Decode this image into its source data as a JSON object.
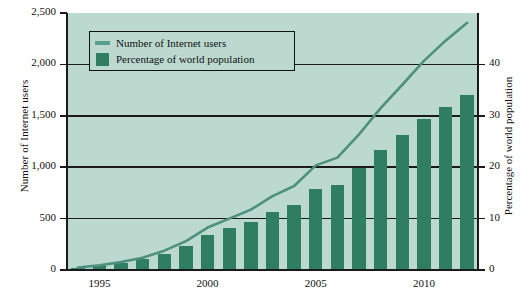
{
  "chart_data": {
    "type": "bar",
    "title": "",
    "xlabel": "",
    "ylabel": "Number of Internet users",
    "ylabel_right": "Percentage of world population",
    "grid": true,
    "legend_position": "top-left-inside",
    "x": [
      1994,
      1995,
      1996,
      1997,
      1998,
      1999,
      2000,
      2001,
      2002,
      2003,
      2004,
      2005,
      2006,
      2007,
      2008,
      2009,
      2010,
      2011,
      2012
    ],
    "xtick_labels": [
      "1995",
      "2000",
      "2005",
      "2010"
    ],
    "xtick_values": [
      1995,
      2000,
      2005,
      2010
    ],
    "ylim": [
      0,
      2500
    ],
    "ytick_labels": [
      "0",
      "500",
      "1,000",
      "1,500",
      "2,000",
      "2,500"
    ],
    "ytick_values": [
      0,
      500,
      1000,
      1500,
      2000,
      2500
    ],
    "ylim_right": [
      0,
      50
    ],
    "ytick_right_labels": [
      "0",
      "10",
      "20",
      "30",
      "40"
    ],
    "ytick_right_values": [
      0,
      10,
      20,
      30,
      40
    ],
    "series": [
      {
        "name": "Number of Internet users",
        "type": "line",
        "axis": "left",
        "unit": "millions",
        "color": "#4e8f7d",
        "values": [
          25,
          45,
          77,
          120,
          188,
          281,
          413,
          500,
          587,
          719,
          817,
          1018,
          1093,
          1319,
          1574,
          1802,
          2034,
          2231,
          2405
        ]
      },
      {
        "name": "Percentage of world population",
        "type": "bar",
        "axis": "right",
        "unit": "percent",
        "color": "#2f7e62",
        "values": [
          0.4,
          0.8,
          1.4,
          2.1,
          3.2,
          4.7,
          6.8,
          8.1,
          9.4,
          11.3,
          12.7,
          15.7,
          16.6,
          19.8,
          23.3,
          26.2,
          29.4,
          31.8,
          34.0
        ]
      }
    ]
  },
  "legend": {
    "items": [
      {
        "label": "Number of Internet users",
        "swatch": "line",
        "color": "#5a9e8d"
      },
      {
        "label": "Percentage of world population",
        "swatch": "box",
        "color": "#2f7e62"
      }
    ]
  },
  "axes": {
    "left_title": "Number of Internet users",
    "right_title": "Percentage of world population"
  },
  "colors": {
    "plot_background": "#bcd9d0",
    "bar": "#2f7e62",
    "line": "#4e8f7d",
    "axis": "#1a1a1a",
    "page_background": "#ffffff"
  }
}
